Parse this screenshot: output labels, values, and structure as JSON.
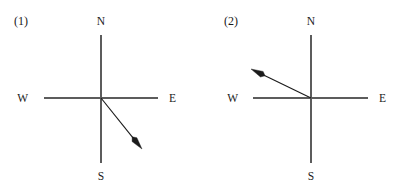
{
  "figure": {
    "type": "compass-direction-diagrams",
    "background_color": "#ffffff",
    "axis_color": "#5c5c5c",
    "vector_color": "#1b1b1b",
    "text_color": "#1a1a1a",
    "panels": [
      {
        "id": "panel-1",
        "label": "(1)",
        "label_x": 14,
        "label_y": 25,
        "center_x": 101,
        "center_y": 98,
        "axis": {
          "west_x": 44,
          "east_x": 158,
          "north_y": 35,
          "south_y": 163
        },
        "cardinals": {
          "north": {
            "text": "N",
            "x": 101,
            "y": 25
          },
          "south": {
            "text": "S",
            "x": 101,
            "y": 180
          },
          "east": {
            "text": "E",
            "x": 169,
            "y": 102
          },
          "west": {
            "text": "W",
            "x": 28,
            "y": 102
          }
        },
        "vector": {
          "from_x": 101,
          "from_y": 98,
          "to_x": 142,
          "to_y": 149,
          "direction": "southeast",
          "angle_below_horizontal_deg": 51,
          "bearing_deg": 141
        }
      },
      {
        "id": "panel-2",
        "label": "(2)",
        "label_x": 224,
        "label_y": 25,
        "center_x": 311,
        "center_y": 98,
        "axis": {
          "west_x": 253,
          "east_x": 368,
          "north_y": 35,
          "south_y": 163
        },
        "cardinals": {
          "north": {
            "text": "N",
            "x": 311,
            "y": 25
          },
          "south": {
            "text": "S",
            "x": 311,
            "y": 180
          },
          "east": {
            "text": "E",
            "x": 379,
            "y": 102
          },
          "west": {
            "text": "W",
            "x": 238,
            "y": 102
          }
        },
        "vector": {
          "from_x": 311,
          "from_y": 98,
          "to_x": 251,
          "to_y": 69,
          "direction": "northwest",
          "angle_above_horizontal_deg": 26,
          "bearing_deg": 296
        }
      }
    ]
  }
}
